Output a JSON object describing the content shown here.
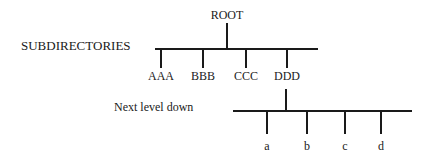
{
  "diagram": {
    "root": {
      "label": "ROOT"
    },
    "level1": {
      "caption": "SUBDIRECTORIES",
      "nodes": [
        {
          "label": "AAA"
        },
        {
          "label": "BBB"
        },
        {
          "label": "CCC"
        },
        {
          "label": "DDD"
        }
      ]
    },
    "level2": {
      "caption": "Next level down",
      "parent": "DDD",
      "nodes": [
        {
          "label": "a"
        },
        {
          "label": "b"
        },
        {
          "label": "c"
        },
        {
          "label": "d"
        }
      ]
    }
  }
}
